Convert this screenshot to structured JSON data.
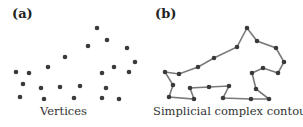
{
  "panels": [
    {
      "label": "(a)",
      "caption": "Vertices",
      "vertices": [
        [
          16,
          72
        ],
        [
          29,
          73
        ],
        [
          48,
          67
        ],
        [
          65,
          57
        ],
        [
          88,
          46
        ],
        [
          97,
          28
        ],
        [
          107,
          40
        ],
        [
          127,
          48
        ],
        [
          135,
          62
        ],
        [
          114,
          67
        ],
        [
          102,
          73
        ],
        [
          129,
          72
        ],
        [
          23,
          84
        ],
        [
          41,
          88
        ],
        [
          60,
          87
        ],
        [
          80,
          86
        ],
        [
          106,
          88
        ],
        [
          20,
          97
        ],
        [
          44,
          99
        ],
        [
          74,
          98
        ],
        [
          102,
          98
        ],
        [
          119,
          99
        ]
      ]
    },
    {
      "label": "(b)",
      "caption": "Simplicial complex contour",
      "contour": [
        [
          247,
          28
        ],
        [
          257,
          41
        ],
        [
          276,
          48
        ],
        [
          284,
          62
        ],
        [
          278,
          73
        ],
        [
          263,
          68
        ],
        [
          252,
          73
        ],
        [
          256,
          89
        ],
        [
          269,
          99
        ],
        [
          251,
          99
        ],
        [
          223,
          98
        ],
        [
          229,
          86
        ],
        [
          209,
          87
        ],
        [
          190,
          88
        ],
        [
          194,
          99
        ],
        [
          169,
          97
        ],
        [
          173,
          85
        ],
        [
          165,
          72
        ],
        [
          179,
          74
        ],
        [
          198,
          67
        ],
        [
          214,
          58
        ],
        [
          237,
          47
        ]
      ]
    }
  ],
  "colors": {
    "dot": "#3a3a3a",
    "edge": "#7a7a7a"
  }
}
